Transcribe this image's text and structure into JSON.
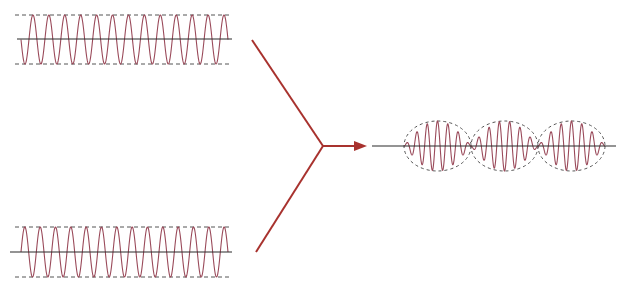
{
  "diagram": {
    "title": "Superposition of two waves producing beats",
    "colors": {
      "wave": "#9a4a5a",
      "axis": "#2a2a2a",
      "guide": "#555555",
      "arrow": "#a8322e",
      "background": "#ffffff"
    },
    "input_waves": [
      {
        "id": "wave-1",
        "axis": {
          "x1": 17,
          "x2": 232,
          "y": 39
        },
        "envelope": {
          "top": 15,
          "bottom": 64,
          "x1": 15,
          "x2": 232
        },
        "wave": {
          "x_start": 21,
          "x_end": 228,
          "cycles": 13,
          "phase": "sin-start-down"
        }
      },
      {
        "id": "wave-2",
        "axis": {
          "x1": 10,
          "x2": 232,
          "y": 252
        },
        "envelope": {
          "top": 227,
          "bottom": 277,
          "x1": 15,
          "x2": 232
        },
        "wave": {
          "x_start": 21,
          "x_end": 228,
          "cycles": 13.5,
          "phase": "sin-start-up"
        }
      }
    ],
    "combiner": {
      "upper_line": {
        "x1": 252,
        "y1": 40,
        "x2": 323,
        "y2": 146
      },
      "lower_line": {
        "x1": 256,
        "y1": 252,
        "x2": 323,
        "y2": 146
      },
      "arrow": {
        "x1": 323,
        "y1": 146,
        "x2": 367,
        "y2": 146
      }
    },
    "output_wave": {
      "axis": {
        "x1": 372,
        "x2": 616,
        "y": 146
      },
      "amplitude": 25,
      "lobes": [
        {
          "x1": 404,
          "x2": 471
        },
        {
          "x1": 471,
          "x2": 538
        },
        {
          "x1": 538,
          "x2": 605
        }
      ],
      "carrier_cycles_per_lobe": 6.5
    }
  }
}
